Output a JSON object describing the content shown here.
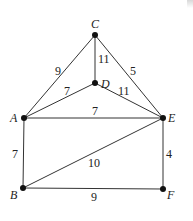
{
  "graph": {
    "nodes": [
      {
        "id": "C",
        "x": 95,
        "y": 35,
        "lx": 91,
        "ly": 28
      },
      {
        "id": "D",
        "x": 95,
        "y": 83,
        "lx": 101,
        "ly": 88
      },
      {
        "id": "A",
        "x": 24,
        "y": 118,
        "lx": 10,
        "ly": 122
      },
      {
        "id": "E",
        "x": 163,
        "y": 118,
        "lx": 168,
        "ly": 122
      },
      {
        "id": "B",
        "x": 23,
        "y": 188,
        "lx": 10,
        "ly": 199
      },
      {
        "id": "F",
        "x": 163,
        "y": 189,
        "lx": 167,
        "ly": 199
      }
    ],
    "edges": [
      {
        "from": "C",
        "to": "A",
        "weight": "9",
        "lx": 55,
        "ly": 75
      },
      {
        "from": "C",
        "to": "E",
        "weight": "5",
        "lx": 130,
        "ly": 75
      },
      {
        "from": "C",
        "to": "D",
        "weight": "11",
        "lx": 98,
        "ly": 63
      },
      {
        "from": "D",
        "to": "A",
        "weight": "7",
        "lx": 64,
        "ly": 95
      },
      {
        "from": "D",
        "to": "E",
        "weight": "11",
        "lx": 118,
        "ly": 95
      },
      {
        "from": "A",
        "to": "E",
        "weight": "7",
        "lx": 92,
        "ly": 115
      },
      {
        "from": "A",
        "to": "B",
        "weight": "7",
        "lx": 12,
        "ly": 158
      },
      {
        "from": "B",
        "to": "E",
        "weight": "10",
        "lx": 88,
        "ly": 167
      },
      {
        "from": "E",
        "to": "F",
        "weight": "4",
        "lx": 166,
        "ly": 158
      },
      {
        "from": "B",
        "to": "F",
        "weight": "9",
        "lx": 91,
        "ly": 201
      }
    ]
  },
  "colors": {
    "edge": "#333333",
    "node": "#111111"
  }
}
